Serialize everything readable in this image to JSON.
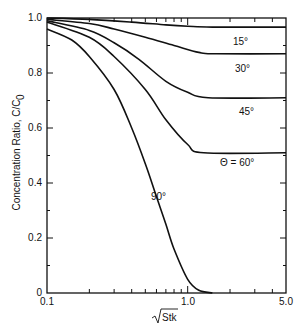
{
  "chart_data": {
    "type": "line",
    "title": "",
    "xlabel": "√Stk",
    "ylabel": "Concentration Ratio, C/C0",
    "xscale": "log",
    "xlim": [
      0.1,
      5.0
    ],
    "ylim": [
      0,
      1.0
    ],
    "x_tick_labels": [
      "0.1",
      "1.0",
      "5.0"
    ],
    "y_tick_labels": [
      "0",
      "0.2",
      "0.4",
      "0.6",
      "0.8",
      "1.0"
    ],
    "grid": false,
    "series": [
      {
        "name": "15°",
        "label": "15°",
        "points": [
          [
            0.1,
            1.0
          ],
          [
            0.2,
            0.995
          ],
          [
            0.4,
            0.985
          ],
          [
            0.7,
            0.975
          ],
          [
            1.0,
            0.97
          ],
          [
            1.5,
            0.967
          ],
          [
            5.0,
            0.967
          ]
        ]
      },
      {
        "name": "30°",
        "label": "30°",
        "points": [
          [
            0.1,
            0.995
          ],
          [
            0.2,
            0.98
          ],
          [
            0.3,
            0.96
          ],
          [
            0.5,
            0.93
          ],
          [
            0.8,
            0.9
          ],
          [
            1.2,
            0.875
          ],
          [
            1.6,
            0.87
          ],
          [
            5.0,
            0.87
          ]
        ]
      },
      {
        "name": "45°",
        "label": "45°",
        "points": [
          [
            0.1,
            0.99
          ],
          [
            0.2,
            0.955
          ],
          [
            0.3,
            0.91
          ],
          [
            0.45,
            0.85
          ],
          [
            0.7,
            0.77
          ],
          [
            1.0,
            0.73
          ],
          [
            1.4,
            0.71
          ],
          [
            5.0,
            0.71
          ]
        ]
      },
      {
        "name": "60°",
        "label": "Θ = 60°",
        "points": [
          [
            0.1,
            0.985
          ],
          [
            0.2,
            0.93
          ],
          [
            0.3,
            0.86
          ],
          [
            0.5,
            0.74
          ],
          [
            0.7,
            0.63
          ],
          [
            1.0,
            0.54
          ],
          [
            1.3,
            0.51
          ],
          [
            5.0,
            0.51
          ]
        ]
      },
      {
        "name": "90°",
        "label": "90°",
        "points": [
          [
            0.1,
            0.96
          ],
          [
            0.15,
            0.92
          ],
          [
            0.2,
            0.86
          ],
          [
            0.3,
            0.74
          ],
          [
            0.4,
            0.6
          ],
          [
            0.5,
            0.47
          ],
          [
            0.6,
            0.35
          ],
          [
            0.7,
            0.25
          ],
          [
            0.8,
            0.16
          ],
          [
            1.0,
            0.05
          ],
          [
            1.2,
            0.01
          ],
          [
            1.5,
            0.0
          ]
        ]
      }
    ]
  },
  "labels": {
    "y_axis_title": "Concentration Ratio, C/C",
    "y_axis_sub": "0",
    "x_axis_title": "Stk",
    "curve_15": "15°",
    "curve_30": "30°",
    "curve_45": "45°",
    "curve_60": "Θ = 60°",
    "curve_90": "90°",
    "x_ticks": [
      "0.1",
      "1.0",
      "5.0"
    ],
    "y_ticks": [
      "0",
      "0.2",
      "0.4",
      "0.6",
      "0.8",
      "1.0"
    ]
  }
}
